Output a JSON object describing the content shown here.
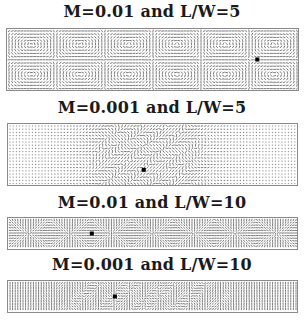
{
  "figure": {
    "panels": [
      {
        "title": "M=0.01 and L/W=5",
        "mach": 0.01,
        "aspect_ratio": 5,
        "field": "cells",
        "cells": 6,
        "mark_x": 0.86,
        "mark_y": 0.5
      },
      {
        "title": "M=0.001 and L/W=5",
        "mach": 0.001,
        "aspect_ratio": 5,
        "field": "center",
        "center_x": 0.48,
        "spread": 0.13,
        "mark_x": 0.47,
        "mark_y": 0.75
      },
      {
        "title": "M=0.01 and L/W=10",
        "mach": 0.01,
        "aspect_ratio": 10,
        "field": "dense",
        "cells": 7,
        "mark_x": 0.29,
        "mark_y": 0.5
      },
      {
        "title": "M=0.001 and L/W=10",
        "mach": 0.001,
        "aspect_ratio": 10,
        "field": "dense-center",
        "center_x": 0.47,
        "spread": 0.22,
        "mark_x": 0.37,
        "mark_y": 0.5
      }
    ]
  }
}
